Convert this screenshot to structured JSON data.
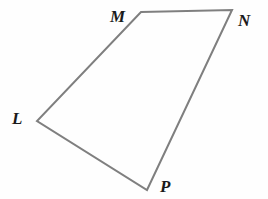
{
  "figure": {
    "kind": "quadrilateral-diagram",
    "name": "Quadrilateral LMNP",
    "background_color": "#fefefe",
    "stroke_color": "#7f7f7f",
    "stroke_width": 2,
    "label_color": "#1a1a1a",
    "canvas": {
      "width": 268,
      "height": 199
    },
    "vertices": [
      {
        "id": "M",
        "label": "M",
        "x": 141,
        "y": 12,
        "label_x": 110,
        "label_y": 8
      },
      {
        "id": "N",
        "label": "N",
        "x": 232,
        "y": 10,
        "label_x": 238,
        "label_y": 12
      },
      {
        "id": "P",
        "label": "P",
        "x": 147,
        "y": 190,
        "label_x": 160,
        "label_y": 178
      },
      {
        "id": "L",
        "label": "L",
        "x": 37,
        "y": 121,
        "label_x": 12,
        "label_y": 110
      }
    ],
    "edges": [
      {
        "id": "MN",
        "from": "M",
        "to": "N"
      },
      {
        "id": "NP",
        "from": "N",
        "to": "P"
      },
      {
        "id": "PL",
        "from": "P",
        "to": "L"
      },
      {
        "id": "LM",
        "from": "L",
        "to": "M"
      }
    ],
    "path_points": "141,12 232,10 147,190 37,121"
  }
}
